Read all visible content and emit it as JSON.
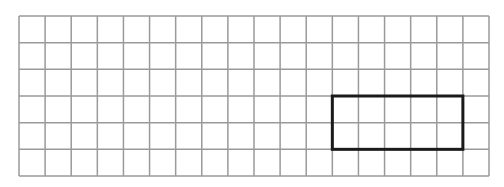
{
  "grid": {
    "columns": 18,
    "rows": 6,
    "x0": 19,
    "y0": 16,
    "x1": 489,
    "y1": 176,
    "line_color": "#9a9a9a",
    "line_width": 1.5
  },
  "highlight_rectangle": {
    "col_start": 12,
    "col_end": 17,
    "row_start": 3,
    "row_end": 5,
    "width_cells": 5,
    "height_cells": 2,
    "stroke_color": "#1a1a1a",
    "stroke_width": 3
  }
}
